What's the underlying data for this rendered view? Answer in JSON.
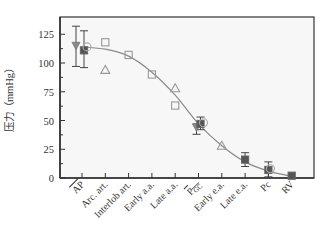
{
  "chart_data": {
    "type": "scatter",
    "title": "",
    "xlabel": "",
    "ylabel": "压力（mmHg）",
    "ylim": [
      0,
      140
    ],
    "yticks": [
      0,
      25,
      50,
      75,
      100,
      125
    ],
    "grid": false,
    "legend": null,
    "categories": [
      "AP",
      "Arc. art.",
      "Interlob art.",
      "Early a.a.",
      "Late a.a.",
      "P_GC",
      "Early e.a.",
      "Late e.a.",
      "Pc",
      "RV"
    ],
    "category_display": [
      {
        "main": "AP",
        "overline": true
      },
      {
        "main": "Arc. art."
      },
      {
        "main": "Interlob art."
      },
      {
        "main": "Early a.a."
      },
      {
        "main": "Late a.a."
      },
      {
        "main": "P",
        "sub": "GC",
        "overline": true
      },
      {
        "main": "Early e.a."
      },
      {
        "main": "Late e.a."
      },
      {
        "main": "Pc"
      },
      {
        "main": "RV"
      }
    ],
    "series": [
      {
        "name": "open squares",
        "marker": "square-open",
        "points": [
          {
            "category": "Arc. art.",
            "y": 118
          },
          {
            "category": "Interlob art.",
            "y": 107
          },
          {
            "category": "Early a.a.",
            "y": 90
          },
          {
            "category": "Late a.a.",
            "y": 63
          }
        ]
      },
      {
        "name": "open triangles",
        "marker": "triangle-open",
        "points": [
          {
            "category": "Arc. art.",
            "y": 94
          },
          {
            "category": "Late a.a.",
            "y": 78
          },
          {
            "category": "Early e.a.",
            "y": 28
          }
        ]
      },
      {
        "name": "filled triangle (down)",
        "marker": "triangle-down-filled",
        "points": [
          {
            "category": "AP",
            "y": 115,
            "dx": -6,
            "err_low": 97,
            "err_high": 132
          },
          {
            "category": "P_GC",
            "y": 44,
            "dx": -2,
            "err_low": 38,
            "err_high": 47
          }
        ]
      },
      {
        "name": "filled squares",
        "marker": "square-filled",
        "points": [
          {
            "category": "AP",
            "y": 111,
            "dx": 2,
            "err_low": 96,
            "err_high": 128
          },
          {
            "category": "P_GC",
            "y": 47,
            "dx": 2,
            "err_low": 42,
            "err_high": 53
          },
          {
            "category": "Late e.a.",
            "y": 16,
            "err_low": 10,
            "err_high": 22
          },
          {
            "category": "Pc",
            "y": 7,
            "err_low": 1,
            "err_high": 14
          },
          {
            "category": "RV",
            "y": 2
          }
        ]
      },
      {
        "name": "open circles",
        "marker": "circle-open",
        "points": [
          {
            "category": "AP",
            "y": 114,
            "dx": 5
          },
          {
            "category": "P_GC",
            "y": 48,
            "dx": 5
          },
          {
            "category": "Pc",
            "y": 8,
            "dx": 2
          }
        ]
      }
    ],
    "fit_curve": {
      "type": "sigmoid",
      "points": [
        [
          0,
          114
        ],
        [
          1,
          112
        ],
        [
          2,
          106
        ],
        [
          3,
          92
        ],
        [
          4,
          72
        ],
        [
          5,
          47
        ],
        [
          6,
          28
        ],
        [
          7,
          14
        ],
        [
          8,
          6
        ],
        [
          9,
          1.5
        ]
      ]
    }
  },
  "colors": {
    "axis": "#333333",
    "curve": "#8a8a8a",
    "marker_open": "#999999",
    "marker_filled": "#555555",
    "errorbar": "#444444"
  }
}
